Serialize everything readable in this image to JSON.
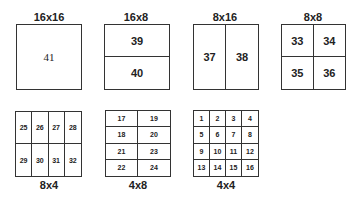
{
  "partitions": [
    {
      "id": "16x16",
      "label": "16x16",
      "cols": 1,
      "rows": 1,
      "cells": [
        "41"
      ]
    },
    {
      "id": "16x8",
      "label": "16x8",
      "cols": 1,
      "rows": 2,
      "cells": [
        "39",
        "40"
      ]
    },
    {
      "id": "8x16",
      "label": "8x16",
      "cols": 2,
      "rows": 1,
      "cells": [
        "37",
        "38"
      ]
    },
    {
      "id": "8x8",
      "label": "8x8",
      "cols": 2,
      "rows": 2,
      "cells": [
        "33",
        "34",
        "35",
        "36"
      ]
    },
    {
      "id": "8x4",
      "label": "8x4",
      "cols": 4,
      "rows": 2,
      "cells": [
        "25",
        "26",
        "27",
        "28",
        "29",
        "30",
        "31",
        "32"
      ]
    },
    {
      "id": "4x8",
      "label": "4x8",
      "cols": 2,
      "rows": 4,
      "cells": [
        "17",
        "19",
        "18",
        "20",
        "21",
        "23",
        "22",
        "24"
      ]
    },
    {
      "id": "4x4",
      "label": "4x4",
      "cols": 4,
      "rows": 4,
      "cells": [
        "1",
        "2",
        "3",
        "4",
        "5",
        "6",
        "7",
        "8",
        "9",
        "10",
        "11",
        "12",
        "13",
        "14",
        "15",
        "16"
      ]
    }
  ],
  "colors": {
    "line": "#333333",
    "text": "#222222",
    "background": "#ffffff"
  }
}
